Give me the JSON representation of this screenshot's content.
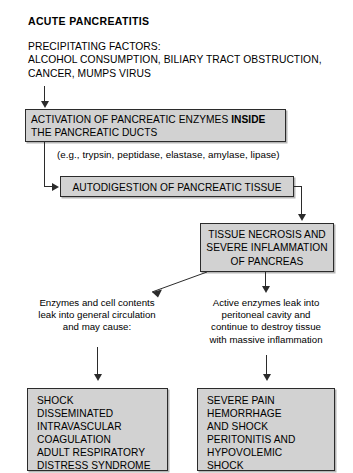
{
  "diagram": {
    "title": "ACUTE PANCREATITIS",
    "precipitating_factors": "PRECIPITATING FACTORS:\nALCOHOL CONSUMPTION, BILIARY TRACT OBSTRUCTION,\nCANCER, MUMPS VIRUS",
    "colors": {
      "box_fill": "#d2d2d2",
      "box_border": "#2b2b2b",
      "text": "#000000",
      "background": "#ffffff",
      "connector": "#2b2b2b"
    },
    "nodes": {
      "activation": {
        "line1_prefix": "ACTIVATION OF PANCREATIC ENZYMES ",
        "line1_bold": "INSIDE",
        "line2": "THE PANCREATIC DUCTS",
        "full_text": "ACTIVATION OF PANCREATIC ENZYMES INSIDE THE PANCREATIC DUCTS"
      },
      "enzyme_note": "(e.g., trypsin, peptidase, elastase, amylase, lipase)",
      "autodigestion": "AUTODIGESTION OF PANCREATIC TISSUE",
      "necrosis": "TISSUE NECROSIS AND\nSEVERE INFLAMMATION\nOF PANCREAS",
      "systemic_path": "Enzymes and cell contents\nleak into general circulation\nand may cause:",
      "local_path": "Active enzymes leak into\nperitoneal cavity and\ncontinue to destroy tissue\nwith massive inflammation",
      "systemic_outcomes": "SHOCK\nDISSEMINATED\nINTRAVASCULAR\nCOAGULATION\nADULT RESPIRATORY\nDISTRESS SYNDROME",
      "local_outcomes": "SEVERE PAIN\nHEMORRHAGE\nAND SHOCK\nPERITONITIS AND\nHYPOVOLEMIC\nSHOCK"
    }
  }
}
